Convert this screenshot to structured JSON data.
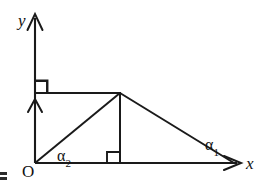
{
  "figure": {
    "type": "geometry-diagram",
    "background_color": "#ffffff",
    "stroke_color": "#1a1a1a",
    "width": 266,
    "height": 188,
    "axes": {
      "y_axis_label": "y",
      "x_axis_label": "x",
      "origin_label": "O",
      "origin_point": [
        35,
        163
      ],
      "y_axis_tip": [
        35,
        14
      ],
      "x_axis_tip": [
        240,
        163
      ]
    },
    "points": {
      "origin": [
        35,
        163
      ],
      "apex": [
        120,
        93
      ],
      "foot": [
        120,
        163
      ],
      "right_base": [
        233,
        163
      ],
      "top_left_corner": [
        35,
        93
      ]
    },
    "segments": [
      {
        "name": "top-horizontal",
        "from": [
          35,
          93
        ],
        "to": [
          120,
          93
        ]
      },
      {
        "name": "vertical-altitude",
        "from": [
          120,
          93
        ],
        "to": [
          120,
          163
        ]
      },
      {
        "name": "left-hypotenuse",
        "from": [
          35,
          163
        ],
        "to": [
          120,
          93
        ]
      },
      {
        "name": "right-hypotenuse",
        "from": [
          120,
          93
        ],
        "to": [
          233,
          163
        ]
      }
    ],
    "angle_labels": [
      {
        "name": "alpha-1",
        "base": "α",
        "subscript": "1",
        "at": [
          233,
          163
        ]
      },
      {
        "name": "alpha-2",
        "base": "α",
        "subscript": "2",
        "at": [
          35,
          163
        ]
      }
    ],
    "right_angle_marks": [
      {
        "name": "top-left-right-angle",
        "at": [
          35,
          93
        ]
      },
      {
        "name": "altitude-foot-right-angle",
        "at": [
          120,
          163
        ]
      }
    ],
    "arrow_heads": [
      {
        "name": "y-axis-arrow",
        "at": [
          35,
          14
        ],
        "direction": "up"
      },
      {
        "name": "y-axis-secondary-arrow",
        "at": [
          35,
          100
        ],
        "direction": "up"
      },
      {
        "name": "x-axis-arrow",
        "at": [
          240,
          163
        ],
        "direction": "right"
      }
    ],
    "artifact": {
      "name": "scan-artifact",
      "at": [
        2,
        174
      ]
    }
  }
}
